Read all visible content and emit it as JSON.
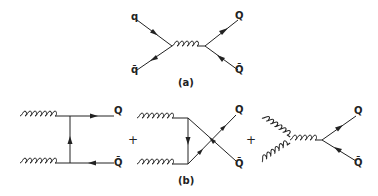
{
  "figure": {
    "panel_a": {
      "caption": "(a)",
      "process": "quark-antiquark annihilation via s-channel gluon",
      "labels": {
        "in_quark": "q",
        "in_antiquark": "q̄",
        "out_quark": "Q",
        "out_antiquark": "Q̄"
      }
    },
    "panel_b": {
      "caption": "(b)",
      "process": "gluon-gluon fusion",
      "plus_signs": [
        "+",
        "+"
      ],
      "diagrams": [
        {
          "type": "t-channel",
          "labels": {
            "out_quark": "Q",
            "out_antiquark": "Q̄"
          }
        },
        {
          "type": "u-channel",
          "labels": {
            "out_quark": "Q",
            "out_antiquark": "Q̄"
          }
        },
        {
          "type": "s-channel",
          "labels": {
            "out_quark": "Q",
            "out_antiquark": "Q̄"
          }
        }
      ]
    }
  }
}
